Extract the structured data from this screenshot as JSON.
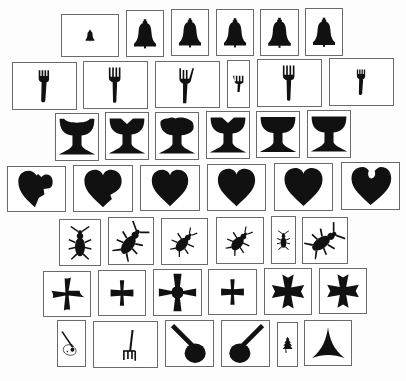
{
  "figure": {
    "ink_color": "#111111",
    "frame_color": "#6a6a6a",
    "rows": [
      {
        "category": "bell",
        "items": [
          {
            "x": 61,
            "y": 14,
            "w": 58,
            "h": 43,
            "shape": "bell",
            "scale": 0.35
          },
          {
            "x": 126,
            "y": 10,
            "w": 38,
            "h": 47,
            "shape": "bell",
            "scale": 1
          },
          {
            "x": 171,
            "y": 9,
            "w": 38,
            "h": 47,
            "shape": "bell",
            "scale": 1
          },
          {
            "x": 216,
            "y": 9,
            "w": 38,
            "h": 47,
            "shape": "bell",
            "scale": 1
          },
          {
            "x": 260,
            "y": 9,
            "w": 39,
            "h": 47,
            "shape": "bell",
            "scale": 1
          },
          {
            "x": 305,
            "y": 8,
            "w": 38,
            "h": 48,
            "shape": "bell",
            "scale": 1
          }
        ]
      },
      {
        "category": "fork",
        "items": [
          {
            "x": 12,
            "y": 62,
            "w": 65,
            "h": 48,
            "shape": "fork-short",
            "scale": 1
          },
          {
            "x": 83,
            "y": 61,
            "w": 65,
            "h": 48,
            "shape": "fork",
            "scale": 1
          },
          {
            "x": 155,
            "y": 61,
            "w": 65,
            "h": 47,
            "shape": "fork-long",
            "scale": 1
          },
          {
            "x": 227,
            "y": 60,
            "w": 23,
            "h": 48,
            "shape": "fork-thin",
            "scale": 1
          },
          {
            "x": 257,
            "y": 59,
            "w": 65,
            "h": 48,
            "shape": "fork",
            "scale": 1
          },
          {
            "x": 329,
            "y": 58,
            "w": 65,
            "h": 48,
            "shape": "fork-short",
            "scale": 0.8
          }
        ]
      },
      {
        "category": "chalice",
        "items": [
          {
            "x": 55,
            "y": 113,
            "w": 44,
            "h": 48,
            "shape": "chalice-notch",
            "scale": 1
          },
          {
            "x": 105,
            "y": 112,
            "w": 44,
            "h": 48,
            "shape": "chalice-v",
            "scale": 1
          },
          {
            "x": 155,
            "y": 112,
            "w": 44,
            "h": 48,
            "shape": "chalice-bump",
            "scale": 1
          },
          {
            "x": 206,
            "y": 111,
            "w": 44,
            "h": 48,
            "shape": "chalice-v",
            "scale": 1
          },
          {
            "x": 256,
            "y": 111,
            "w": 44,
            "h": 47,
            "shape": "chalice",
            "scale": 1
          },
          {
            "x": 307,
            "y": 110,
            "w": 44,
            "h": 48,
            "shape": "chalice",
            "scale": 1
          }
        ]
      },
      {
        "category": "heart",
        "items": [
          {
            "x": 7,
            "y": 166,
            "w": 59,
            "h": 46,
            "shape": "heart-broken",
            "scale": 1
          },
          {
            "x": 73,
            "y": 165,
            "w": 60,
            "h": 47,
            "shape": "heart-dent",
            "scale": 1
          },
          {
            "x": 140,
            "y": 165,
            "w": 60,
            "h": 46,
            "shape": "heart",
            "scale": 1
          },
          {
            "x": 207,
            "y": 164,
            "w": 59,
            "h": 47,
            "shape": "heart",
            "scale": 1
          },
          {
            "x": 274,
            "y": 163,
            "w": 59,
            "h": 48,
            "shape": "heart",
            "scale": 1
          },
          {
            "x": 341,
            "y": 162,
            "w": 59,
            "h": 48,
            "shape": "heart-bite",
            "scale": 1
          }
        ]
      },
      {
        "category": "beetle",
        "items": [
          {
            "x": 59,
            "y": 219,
            "w": 42,
            "h": 47,
            "shape": "beetle",
            "rotate": 0
          },
          {
            "x": 108,
            "y": 217,
            "w": 46,
            "h": 48,
            "shape": "beetle",
            "rotate": 35
          },
          {
            "x": 161,
            "y": 218,
            "w": 47,
            "h": 47,
            "shape": "beetle-small",
            "rotate": 40
          },
          {
            "x": 216,
            "y": 217,
            "w": 48,
            "h": 47,
            "shape": "beetle-small",
            "rotate": 40
          },
          {
            "x": 271,
            "y": 216,
            "w": 25,
            "h": 48,
            "shape": "beetle",
            "rotate": 0
          },
          {
            "x": 302,
            "y": 217,
            "w": 46,
            "h": 47,
            "shape": "beetle",
            "rotate": 55
          }
        ]
      },
      {
        "category": "cross",
        "items": [
          {
            "x": 43,
            "y": 271,
            "w": 48,
            "h": 46,
            "shape": "cross-swirl",
            "scale": 1
          },
          {
            "x": 98,
            "y": 270,
            "w": 48,
            "h": 46,
            "shape": "cross",
            "scale": 0.9
          },
          {
            "x": 153,
            "y": 269,
            "w": 49,
            "h": 47,
            "shape": "cross-round",
            "scale": 1
          },
          {
            "x": 208,
            "y": 269,
            "w": 49,
            "h": 46,
            "shape": "cross",
            "scale": 0.9
          },
          {
            "x": 264,
            "y": 268,
            "w": 48,
            "h": 47,
            "shape": "cross-flared",
            "scale": 1
          },
          {
            "x": 319,
            "y": 268,
            "w": 48,
            "h": 46,
            "shape": "cross-flared",
            "scale": 1
          }
        ]
      },
      {
        "category": "misc",
        "items": [
          {
            "x": 57,
            "y": 320,
            "w": 29,
            "h": 47,
            "shape": "guitar"
          },
          {
            "x": 93,
            "y": 321,
            "w": 65,
            "h": 47,
            "shape": "pitchfork"
          },
          {
            "x": 165,
            "y": 320,
            "w": 49,
            "h": 47,
            "shape": "frying-pan-left"
          },
          {
            "x": 221,
            "y": 320,
            "w": 49,
            "h": 47,
            "shape": "frying-pan-right"
          },
          {
            "x": 277,
            "y": 322,
            "w": 21,
            "h": 45,
            "shape": "tree"
          },
          {
            "x": 304,
            "y": 320,
            "w": 48,
            "h": 46,
            "shape": "tri-star"
          }
        ]
      }
    ]
  }
}
